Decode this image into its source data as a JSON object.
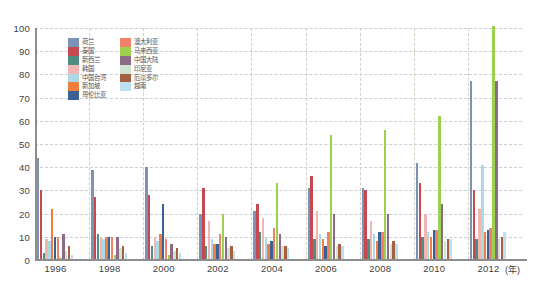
{
  "chart_data": {
    "type": "bar",
    "title": "",
    "xlabel": "(年)",
    "ylabel": "",
    "ylim": [
      0,
      100
    ],
    "ytick_step": 10,
    "yticks": [
      0,
      10,
      20,
      30,
      40,
      50,
      60,
      70,
      80,
      90,
      100
    ],
    "grid": true,
    "legend_position": "inside-top-left",
    "x": [
      "1996",
      "1997",
      "1998",
      "1999",
      "2000",
      "2001",
      "2002",
      "2003",
      "2004",
      "2005",
      "2006",
      "2007",
      "2008",
      "2009",
      "2010",
      "2011",
      "2012",
      "2013"
    ],
    "xtick_labels": [
      "1996",
      "1998",
      "2000",
      "2002",
      "2004",
      "2006",
      "2008",
      "2010",
      "2012"
    ],
    "xtick_positions": [
      0,
      2,
      4,
      6,
      8,
      10,
      12,
      14,
      16
    ],
    "series": [
      {
        "name": "荷兰",
        "color": "#7b93b4",
        "values": [
          44,
          0,
          39,
          0,
          40,
          0,
          20,
          0,
          21,
          0,
          31,
          0,
          31,
          0,
          42,
          0,
          77,
          0
        ]
      },
      {
        "name": "泰国",
        "color": "#c44a52",
        "values": [
          30,
          0,
          27,
          0,
          28,
          0,
          31,
          0,
          24,
          0,
          36,
          0,
          30,
          0,
          33,
          0,
          30,
          0
        ]
      },
      {
        "name": "新西兰",
        "color": "#4e8e81",
        "values": [
          3,
          0,
          11,
          0,
          6,
          0,
          6,
          0,
          12,
          0,
          9,
          0,
          9,
          0,
          10,
          0,
          9,
          0
        ]
      },
      {
        "name": "韩国",
        "color": "#f2b6b2",
        "values": [
          9,
          0,
          10,
          0,
          10,
          0,
          17,
          0,
          18,
          0,
          21,
          0,
          17,
          0,
          20,
          0,
          22,
          0
        ]
      },
      {
        "name": "中国台湾",
        "color": "#add9e6",
        "values": [
          8,
          0,
          9,
          0,
          8,
          0,
          9,
          0,
          10,
          0,
          11,
          0,
          11,
          0,
          12,
          0,
          41,
          0
        ]
      },
      {
        "name": "新加坡",
        "color": "#ef7f3d",
        "values": [
          22,
          0,
          10,
          0,
          11,
          0,
          7,
          0,
          7,
          0,
          9,
          0,
          8,
          0,
          10,
          0,
          12,
          0
        ]
      },
      {
        "name": "哥伦比亚",
        "color": "#3c5f96",
        "values": [
          10,
          0,
          10,
          0,
          24,
          0,
          7,
          0,
          8,
          0,
          6,
          0,
          12,
          0,
          13,
          0,
          13,
          0
        ]
      },
      {
        "name": "澳大利亚",
        "color": "#f2816b",
        "values": [
          10,
          0,
          10,
          0,
          9,
          0,
          11,
          0,
          14,
          0,
          12,
          0,
          12,
          0,
          13,
          0,
          14,
          0
        ]
      },
      {
        "name": "马来西亚",
        "color": "#9dd04e",
        "values": [
          1,
          0,
          2,
          0,
          2,
          0,
          20,
          0,
          33,
          0,
          54,
          0,
          56,
          0,
          62,
          0,
          101,
          0
        ]
      },
      {
        "name": "中国大陆",
        "color": "#8c6b86",
        "values": [
          11,
          0,
          10,
          0,
          7,
          0,
          10,
          0,
          11,
          0,
          20,
          0,
          20,
          0,
          24,
          0,
          77,
          0
        ]
      },
      {
        "name": "印尼亚",
        "color": "#cfe4d2",
        "values": [
          4,
          0,
          5,
          0,
          4,
          0,
          5,
          0,
          6,
          0,
          6,
          0,
          7,
          0,
          8,
          0,
          9,
          0
        ]
      },
      {
        "name": "厄瓜多尔",
        "color": "#a5603f",
        "values": [
          6,
          0,
          6,
          0,
          5,
          0,
          6,
          0,
          6,
          0,
          7,
          0,
          8,
          0,
          9,
          0,
          10,
          0
        ]
      },
      {
        "name": "越南",
        "color": "#bcdff2",
        "values": [
          2,
          0,
          3,
          0,
          3,
          0,
          4,
          0,
          5,
          0,
          6,
          0,
          7,
          0,
          9,
          0,
          12,
          0
        ]
      }
    ]
  }
}
